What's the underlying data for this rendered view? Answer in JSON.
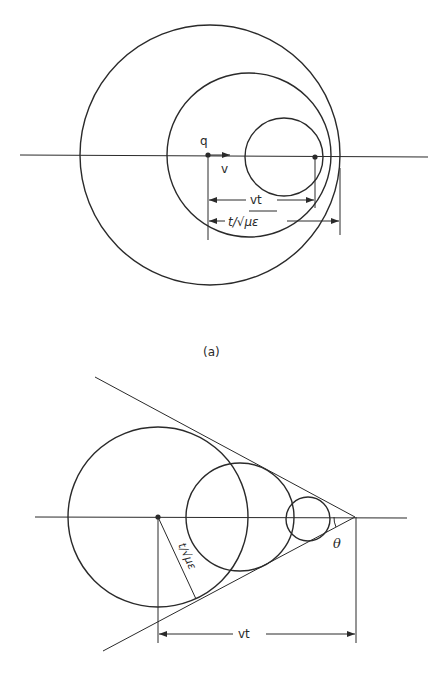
{
  "figure_a": {
    "caption": "(a)",
    "labels": {
      "charge": "q",
      "velocity": "v",
      "distance_vt": "vt",
      "distance_radius": "t/√με"
    }
  },
  "figure_b": {
    "labels": {
      "distance_vt": "vt",
      "radius": "t/√με",
      "angle": "θ"
    }
  },
  "colors": {
    "ink": "#2a2a2a",
    "background": "#ffffff"
  }
}
